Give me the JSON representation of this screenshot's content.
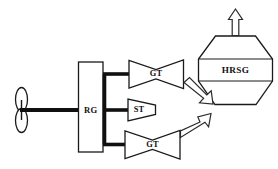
{
  "diagram": {
    "type": "engineering-schematic",
    "background_color": "#ffffff",
    "line_color": "#1a1a1a",
    "components": {
      "propeller": {
        "name": "propeller",
        "label": "",
        "shape": "two-bladed-ellipse-pair"
      },
      "shaft": {
        "name": "propeller-shaft",
        "label": ""
      },
      "reduction_gear": {
        "name": "reduction-gear",
        "label": "RG",
        "shape": "rectangle"
      },
      "gas_turbine_upper": {
        "name": "gas-turbine-upper",
        "label": "GT",
        "shape": "hourglass"
      },
      "steam_turbine": {
        "name": "steam-turbine",
        "label": "ST",
        "shape": "trapezoid"
      },
      "gas_turbine_lower": {
        "name": "gas-turbine-lower",
        "label": "GT",
        "shape": "hourglass"
      },
      "heat_recovery_steam_generator": {
        "name": "hrsg",
        "label": "HRSG",
        "shape": "hexagon-banded"
      },
      "stack_arrow": {
        "name": "exhaust-stack-arrow",
        "label": "",
        "direction": "up"
      },
      "exhaust_arrow_upper": {
        "name": "exhaust-duct-upper",
        "label": "",
        "direction": "down-right"
      },
      "exhaust_arrow_lower": {
        "name": "exhaust-duct-lower",
        "label": "",
        "direction": "up-right"
      }
    }
  }
}
